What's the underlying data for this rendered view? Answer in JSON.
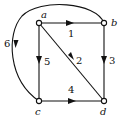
{
  "diagram": {
    "type": "directed-graph",
    "nodes": [
      {
        "id": "a",
        "label": "a"
      },
      {
        "id": "b",
        "label": "b"
      },
      {
        "id": "c",
        "label": "c"
      },
      {
        "id": "d",
        "label": "d"
      }
    ],
    "edges": [
      {
        "id": "e1",
        "from": "a",
        "to": "b",
        "label": "1"
      },
      {
        "id": "e2",
        "from": "a",
        "to": "d",
        "label": "2"
      },
      {
        "id": "e3",
        "from": "b",
        "to": "d",
        "label": "3"
      },
      {
        "id": "e4",
        "from": "c",
        "to": "d",
        "label": "4"
      },
      {
        "id": "e5",
        "from": "a",
        "to": "c",
        "label": "5"
      },
      {
        "id": "e6",
        "from": "b",
        "to": "c",
        "label": "6",
        "curved": true
      }
    ],
    "colors": {
      "stroke": "#111111",
      "background": "#ffffff"
    }
  }
}
